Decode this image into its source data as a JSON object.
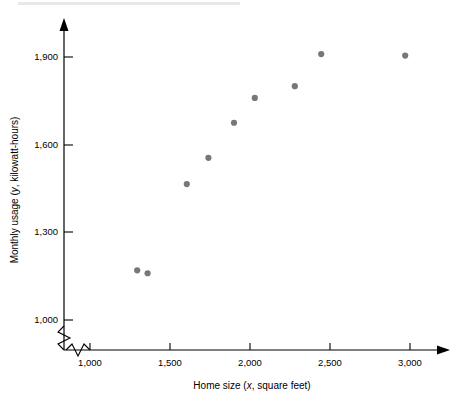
{
  "chart_data": {
    "type": "scatter",
    "title": "",
    "xlabel": "Home size (x, square feet)",
    "ylabel": "Monthly usage (y, kilowatt-hours)",
    "xlabel_prefix": "Home size (",
    "xlabel_var": "x",
    "xlabel_suffix": ", square feet)",
    "ylabel_prefix": "Monthly usage (",
    "ylabel_var": "y",
    "ylabel_suffix": ", kilowatt-hours)",
    "xlim": [
      1000,
      3000
    ],
    "ylim": [
      1000,
      1900
    ],
    "xticks": [
      1000,
      1500,
      2000,
      2500,
      3000
    ],
    "yticks": [
      1000,
      1300,
      1600,
      1900
    ],
    "xtick_labels": [
      "1,000",
      "1,500",
      "2,000",
      "2,500",
      "3,000"
    ],
    "ytick_labels": [
      "1,000",
      "1,300",
      "1,600",
      "1,900"
    ],
    "grid": false,
    "legend": "none",
    "axis_break_x": true,
    "axis_break_y": true,
    "point_color": "#77777b",
    "axis_color": "#000000",
    "x": [
      1295,
      1360,
      1605,
      1740,
      1900,
      2030,
      2280,
      2445,
      2970
    ],
    "y": [
      1170,
      1160,
      1465,
      1555,
      1675,
      1760,
      1800,
      1910,
      1905
    ],
    "points": [
      {
        "x": 1295,
        "y": 1170
      },
      {
        "x": 1360,
        "y": 1160
      },
      {
        "x": 1605,
        "y": 1465
      },
      {
        "x": 1740,
        "y": 1555
      },
      {
        "x": 1900,
        "y": 1675
      },
      {
        "x": 2030,
        "y": 1760
      },
      {
        "x": 2280,
        "y": 1800
      },
      {
        "x": 2445,
        "y": 1910
      },
      {
        "x": 2970,
        "y": 1905
      }
    ]
  }
}
